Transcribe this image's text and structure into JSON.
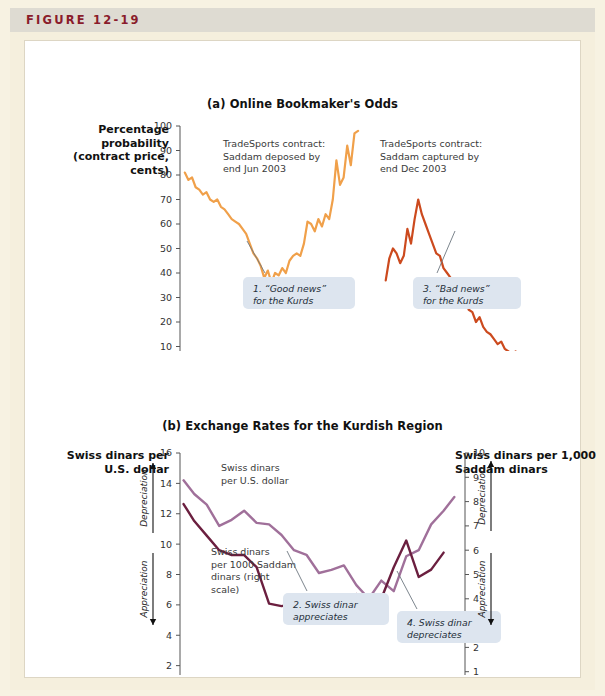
{
  "figure": {
    "label": "FIGURE 12-19",
    "accent_color": "#8a1c2b",
    "header_bg": "#dedbd2",
    "page_bg": "#f5efdd",
    "card_bg": "#ffffff"
  },
  "panel_a": {
    "title": "(a) Online Bookmaker's Odds",
    "y_axis_title": "Percentage probability (contract price, cents)",
    "series_note_1": "TradeSports contract: Saddam deposed by end Jun 2003",
    "series_note_2": "TradeSports contract: Saddam captured by end Dec 2003",
    "callout_1": "1. “Good news” for the Kurds",
    "callout_3": "3. “Bad news” for the Kurds",
    "color_deposed": "#f0a04a",
    "color_captured": "#cc4a1e"
  },
  "panel_b": {
    "title": "(b) Exchange Rates for the Kurdish Region",
    "y_axis_title_left": "Swiss dinars per U.S. dollar",
    "y_axis_title_right": "Swiss dinars per 1,000 Saddam dinars",
    "series_note_left": "Swiss dinars per U.S. dollar",
    "series_note_right": "Swiss dinars per 1000 Saddam dinars (right scale)",
    "callout_2": "2. Swiss dinar appreciates",
    "callout_4": "4. Swiss dinar depreciates",
    "arrow_up_label": "Depreciation",
    "arrow_down_label": "Appreciation",
    "color_usd": "#a0709a",
    "color_saddam": "#6b1f3f"
  },
  "chart_data": [
    {
      "type": "line",
      "id": "panel-a",
      "title": "(a) Online Bookmaker's Odds",
      "xlabel": "",
      "ylabel": "Percentage probability (contract price, cents)",
      "ylim": [
        0,
        100
      ],
      "yticks": [
        0,
        10,
        20,
        30,
        40,
        50,
        60,
        70,
        80,
        90,
        100
      ],
      "xlim": [
        0,
        16
      ],
      "xticks": [
        0,
        3,
        6,
        9,
        12,
        15
      ],
      "xticklabels": [
        "Sep 2002",
        "Dec 2002",
        "Mar 2003",
        "Jun 2003",
        "Sep 2003",
        "Dec 2003"
      ],
      "grid": false,
      "legend": "none",
      "series": [
        {
          "name": "TradeSports contract: Saddam deposed by end Jun 2003",
          "color": "#f0a04a",
          "x": [
            0.2,
            0.35,
            0.5,
            0.65,
            0.8,
            0.95,
            1.1,
            1.25,
            1.4,
            1.55,
            1.7,
            1.85,
            2.0,
            2.15,
            2.3,
            2.45,
            2.6,
            2.75,
            2.9,
            3.05,
            3.2,
            3.35,
            3.5,
            3.65,
            3.8,
            3.95,
            4.1,
            4.25,
            4.4,
            4.55,
            4.7,
            4.85,
            5.0,
            5.15,
            5.3,
            5.45,
            5.6,
            5.75,
            5.9,
            6.05,
            6.2,
            6.35,
            6.5,
            6.65,
            6.8,
            6.95,
            7.1,
            7.25,
            7.4
          ],
          "y": [
            81,
            78,
            79,
            75,
            74,
            72,
            73,
            70,
            69,
            70,
            67,
            66,
            64,
            62,
            61,
            60,
            58,
            56,
            52,
            48,
            46,
            43,
            38,
            41,
            36,
            40,
            39,
            42,
            40,
            45,
            47,
            48,
            47,
            52,
            61,
            60,
            57,
            62,
            59,
            64,
            62,
            70,
            86,
            76,
            79,
            92,
            84,
            97,
            98
          ]
        },
        {
          "name": "TradeSports contract: Saddam captured by end Dec 2003",
          "color": "#cc4a1e",
          "x": [
            8.55,
            8.7,
            8.85,
            9.0,
            9.15,
            9.3,
            9.45,
            9.6,
            9.75,
            9.9,
            10.05,
            10.2,
            10.35,
            10.5,
            10.65,
            10.8,
            10.95,
            11.1,
            11.25,
            11.4,
            11.55,
            11.7,
            11.85,
            12.0,
            12.15,
            12.3,
            12.45,
            12.6,
            12.75,
            12.9,
            13.05,
            13.2,
            13.35,
            13.5,
            13.65,
            13.8,
            13.95,
            14.1,
            14.25,
            14.4,
            14.55,
            14.7,
            14.85,
            15.0
          ],
          "y": [
            37,
            46,
            50,
            48,
            44,
            47,
            58,
            52,
            62,
            70,
            64,
            60,
            56,
            52,
            48,
            47,
            42,
            40,
            38,
            34,
            30,
            27,
            29,
            25,
            24,
            20,
            22,
            18,
            16,
            15,
            13,
            11,
            12,
            9,
            8,
            7,
            8,
            6,
            5,
            4,
            4,
            3,
            5,
            3
          ]
        }
      ]
    },
    {
      "type": "line",
      "id": "panel-b",
      "title": "(b) Exchange Rates for the Kurdish Region",
      "xlabel": "",
      "ylabel": "Swiss dinars per U.S. dollar",
      "ylabel_right": "Swiss dinars per 1,000 Saddam dinars",
      "ylim": [
        0,
        16
      ],
      "yticks": [
        0,
        2,
        4,
        6,
        8,
        10,
        12,
        14,
        16
      ],
      "ylim_right": [
        0,
        10
      ],
      "yticks_right": [
        0,
        1,
        2,
        3,
        4,
        5,
        6,
        7,
        8,
        9,
        10
      ],
      "xlim": [
        0,
        16
      ],
      "xticks": [
        0,
        3,
        6,
        9,
        12,
        15
      ],
      "xticklabels": [
        "Sep 2002",
        "Dec 2002",
        "Mar 2003",
        "Jun 2003",
        "Sep 2003",
        "Dec 2003"
      ],
      "grid": false,
      "legend": "inline-labels",
      "series": [
        {
          "name": "Swiss dinars per U.S. dollar",
          "color": "#a0709a",
          "axis": "left",
          "x": [
            0.2,
            0.8,
            1.5,
            2.2,
            2.9,
            3.6,
            4.3,
            5.0,
            5.7,
            6.4,
            7.1,
            7.8,
            8.5,
            9.2,
            9.9,
            10.6,
            11.3,
            12.0,
            12.7,
            13.4,
            14.1,
            14.8,
            15.4
          ],
          "y": [
            14.2,
            13.3,
            12.6,
            11.2,
            11.6,
            12.2,
            11.4,
            11.3,
            10.6,
            9.6,
            9.3,
            8.1,
            8.3,
            8.6,
            7.3,
            6.4,
            7.6,
            6.9,
            9.2,
            9.6,
            11.3,
            12.2,
            13.1
          ]
        },
        {
          "name": "Swiss dinars per 1000 Saddam dinars (right scale)",
          "color": "#6b1f3f",
          "axis": "right",
          "x": [
            0.2,
            0.8,
            1.5,
            2.2,
            2.9,
            3.6,
            4.3,
            5.0,
            5.7,
            6.4,
            7.1,
            7.8,
            8.5,
            9.2,
            9.9,
            10.6,
            11.3,
            12.0,
            12.7,
            13.4,
            14.1,
            14.8
          ],
          "y": [
            7.9,
            7.2,
            6.6,
            6.0,
            5.8,
            5.8,
            5.3,
            3.8,
            3.7,
            3.8,
            3.6,
            3.4,
            3.8,
            3.4,
            4.2,
            3.6,
            4.0,
            5.3,
            6.4,
            4.9,
            5.2,
            5.9
          ]
        }
      ]
    }
  ]
}
